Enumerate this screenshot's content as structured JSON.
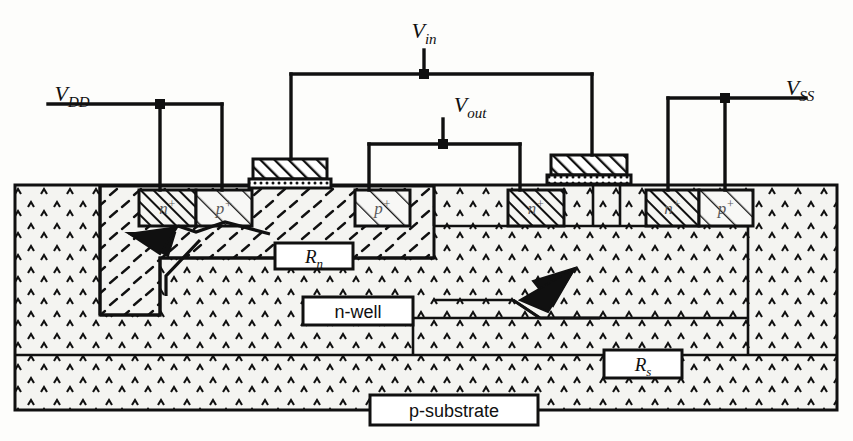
{
  "diagram": {
    "background": "#fdfdfb",
    "ink": "#101010"
  },
  "terminals": [
    {
      "name": "vdd",
      "label": "V",
      "sub": "DD",
      "x": 72,
      "y": 101
    },
    {
      "name": "vin",
      "label": "V",
      "sub": "in",
      "x": 424,
      "y": 38
    },
    {
      "name": "vout",
      "label": "V",
      "sub": "out",
      "x": 470,
      "y": 112
    },
    {
      "name": "vss",
      "label": "V",
      "sub": "SS",
      "x": 800,
      "y": 95
    }
  ],
  "region_labels": [
    {
      "name": "rn-label",
      "label": "R",
      "sub": "n",
      "x": 275,
      "y": 243,
      "w": 78,
      "h": 26,
      "italic": true
    },
    {
      "name": "nwell-label",
      "label": "n-well",
      "sub": "",
      "x": 303,
      "y": 297,
      "w": 110,
      "h": 28,
      "italic": false
    },
    {
      "name": "rs-label",
      "label": "R",
      "sub": "s",
      "x": 604,
      "y": 350,
      "w": 78,
      "h": 28,
      "italic": true
    },
    {
      "name": "psub-label",
      "label": "p-substrate",
      "sub": "",
      "x": 370,
      "y": 395,
      "w": 168,
      "h": 30,
      "italic": false
    }
  ],
  "diffusions": [
    {
      "name": "diffusion-n-plus-left",
      "label": "n",
      "sup": "+",
      "x": 139,
      "y": 190,
      "w": 57,
      "h": 36,
      "fill": "hatch-dense"
    },
    {
      "name": "diffusion-p-plus-left",
      "label": "p",
      "sup": "+",
      "x": 196,
      "y": 190,
      "w": 56,
      "h": 36,
      "fill": "hatch-sparse"
    },
    {
      "name": "diffusion-p-plus-mid",
      "label": "p",
      "sup": "+",
      "x": 355,
      "y": 190,
      "w": 55,
      "h": 36,
      "fill": "hatch-sparse"
    },
    {
      "name": "diffusion-n-plus-mid",
      "label": "n",
      "sup": "+",
      "x": 508,
      "y": 190,
      "w": 56,
      "h": 36,
      "fill": "hatch-dense"
    },
    {
      "name": "diffusion-n-plus-right",
      "label": "n",
      "sup": "+",
      "x": 646,
      "y": 190,
      "w": 53,
      "h": 36,
      "fill": "hatch-dense"
    },
    {
      "name": "diffusion-p-plus-right",
      "label": "p",
      "sup": "+",
      "x": 699,
      "y": 190,
      "w": 54,
      "h": 36,
      "fill": "hatch-sparse"
    }
  ],
  "gates": [
    {
      "name": "gate-pmos",
      "x": 253,
      "y": 159,
      "w": 74,
      "h": 20,
      "oxide_h": 9
    },
    {
      "name": "gate-nmos",
      "x": 551,
      "y": 155,
      "w": 76,
      "h": 20,
      "oxide_h": 9
    }
  ],
  "layers": {
    "substrate": {
      "name": "p-substrate-body",
      "x": 15,
      "y": 185,
      "w": 822,
      "h": 225,
      "fill": "carets"
    },
    "nwell": {
      "name": "n-well-body",
      "x": 100,
      "y": 185,
      "w": 334,
      "h": 130,
      "fill": "dashes"
    }
  },
  "arrows": [
    {
      "name": "rn-arrow",
      "points": "276,232 247,224 200,240 178,234",
      "tip_at": "left-down"
    },
    {
      "name": "rs-arrow",
      "points": "575,300 540,300 520,318 600,318",
      "tip_at": "right-up"
    }
  ],
  "wires": {
    "vdd_rail_y": 104,
    "vin_rail_y": 74,
    "vout_rail_y": 144,
    "vss_rail_y": 98,
    "node_size": 9
  }
}
